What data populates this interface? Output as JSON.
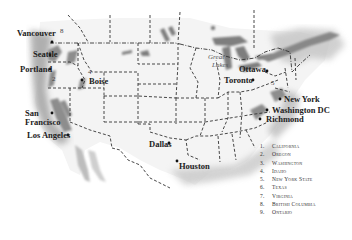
{
  "map": {
    "type": "North America regional map with state/province borders",
    "cities": [
      {
        "name": "Vancouver",
        "x": 5,
        "y": 29
      },
      {
        "name": "Seattle",
        "x": 33,
        "y": 49
      },
      {
        "name": "Portland",
        "x": 20,
        "y": 66
      },
      {
        "name": "Boise",
        "x": 89,
        "y": 77
      },
      {
        "name": "San",
        "x": 24,
        "y": 109
      },
      {
        "name": "Francisco",
        "x": 24,
        "y": 118
      },
      {
        "name": "Los Angeles",
        "x": 27,
        "y": 131
      },
      {
        "name": "Dallas",
        "x": 149,
        "y": 144
      },
      {
        "name": "Houston",
        "x": 178,
        "y": 162
      },
      {
        "name": "Toronto",
        "x": 224,
        "y": 76
      },
      {
        "name": "Ottawa",
        "x": 239,
        "y": 65
      },
      {
        "name": "New York",
        "x": 287,
        "y": 96
      },
      {
        "name": "Washington DC",
        "x": 272,
        "y": 107
      },
      {
        "name": "Richmond",
        "x": 266,
        "y": 116
      }
    ],
    "lake_label": {
      "line1": "Great",
      "line2": "Lakes"
    },
    "region_markers": [
      {
        "num": "2",
        "x": 51,
        "y": 75
      },
      {
        "num": "4",
        "x": 88,
        "y": 69
      },
      {
        "num": "5",
        "x": 270,
        "y": 80
      },
      {
        "num": "8",
        "x": 60,
        "y": 28
      }
    ]
  },
  "legend": {
    "items": [
      {
        "num": "1.",
        "name": "California"
      },
      {
        "num": "2.",
        "name": "Oregon"
      },
      {
        "num": "3.",
        "name": "Washington"
      },
      {
        "num": "4.",
        "name": "Idaho"
      },
      {
        "num": "5.",
        "name": "New York State"
      },
      {
        "num": "6.",
        "name": "Texas"
      },
      {
        "num": "7.",
        "name": "Virginia"
      },
      {
        "num": "8.",
        "name": "British Columbia"
      },
      {
        "num": "9.",
        "name": "Ontario"
      }
    ]
  },
  "colors": {
    "land": "#f2f2f2",
    "shade": "#9a9a9a",
    "border": "#333333",
    "water": "#7a7a7a"
  }
}
